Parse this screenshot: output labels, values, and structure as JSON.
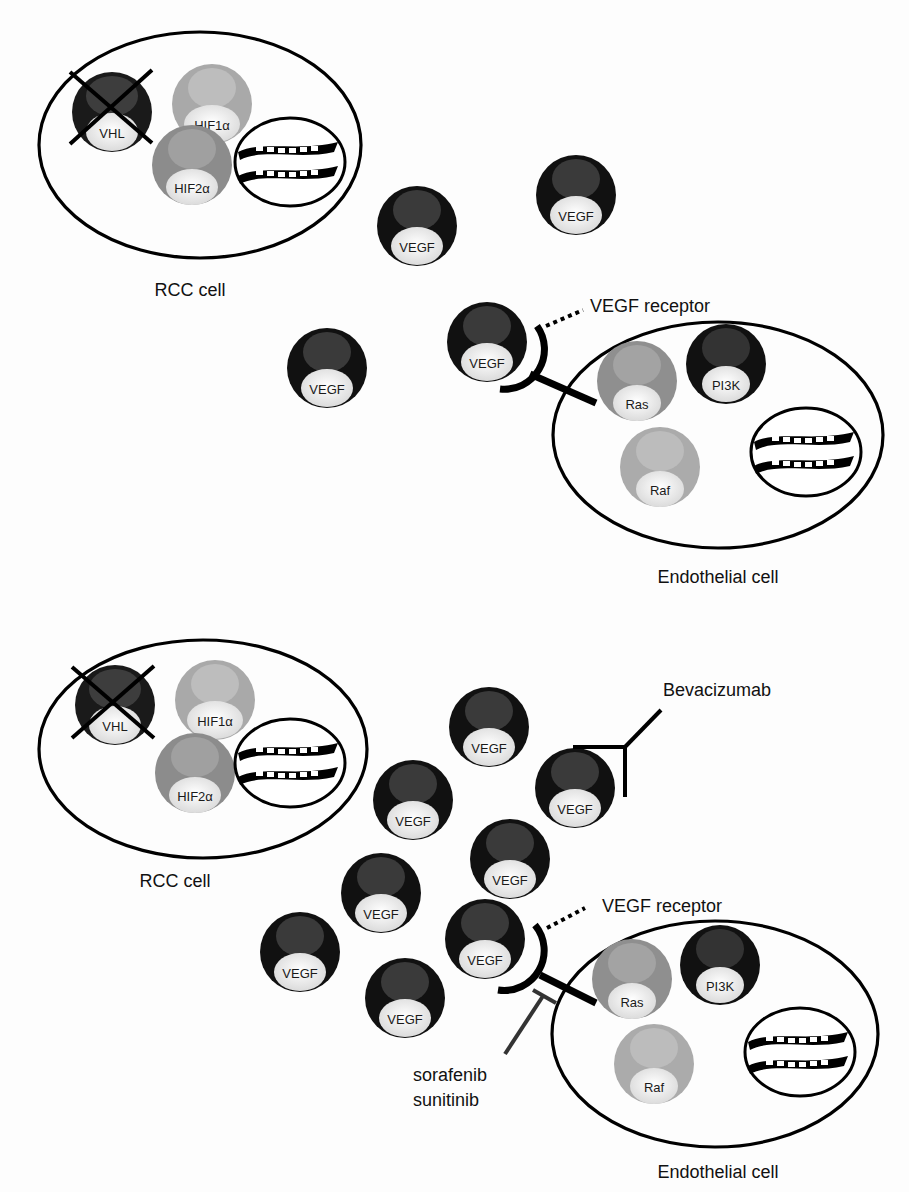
{
  "panels": [
    {
      "id": "top",
      "rcc_cell": {
        "label": "RCC cell",
        "molecules": [
          {
            "name": "VHL",
            "label": "VHL",
            "fill": "#1a1a1a",
            "crossed": true
          },
          {
            "name": "HIF1a",
            "label": "HIF1α",
            "fill": "#a9a9a9"
          },
          {
            "name": "HIF2a",
            "label": "HIF2α",
            "fill": "#8c8c8c"
          }
        ]
      },
      "vegf_label": "VEGF",
      "vegf_count": 4,
      "receptor_label": "VEGF receptor",
      "endothelial_cell": {
        "label": "Endothelial cell",
        "molecules": [
          {
            "name": "Ras",
            "label": "Ras",
            "fill": "#8f8f8f"
          },
          {
            "name": "PI3K",
            "label": "PI3K",
            "fill": "#111111"
          },
          {
            "name": "Raf",
            "label": "Raf",
            "fill": "#ababab"
          }
        ]
      }
    },
    {
      "id": "bottom",
      "rcc_cell": {
        "label": "RCC cell",
        "molecules": [
          {
            "name": "VHL",
            "label": "VHL",
            "fill": "#1a1a1a",
            "crossed": true
          },
          {
            "name": "HIF1a",
            "label": "HIF1α",
            "fill": "#a9a9a9"
          },
          {
            "name": "HIF2a",
            "label": "HIF2α",
            "fill": "#8c8c8c"
          }
        ]
      },
      "vegf_label": "VEGF",
      "vegf_count": 8,
      "antibody_label": "Bevacizumab",
      "receptor_label": "VEGF receptor",
      "inhibitor_labels": [
        "sorafenib",
        "sunitinib"
      ],
      "endothelial_cell": {
        "label": "Endothelial cell",
        "molecules": [
          {
            "name": "Ras",
            "label": "Ras",
            "fill": "#8f8f8f"
          },
          {
            "name": "PI3K",
            "label": "PI3K",
            "fill": "#111111"
          },
          {
            "name": "Raf",
            "label": "Raf",
            "fill": "#ababab"
          }
        ]
      }
    }
  ],
  "colors": {
    "vegf": "#111111",
    "outline": "#000000",
    "inhibitor_line": "#333333"
  }
}
